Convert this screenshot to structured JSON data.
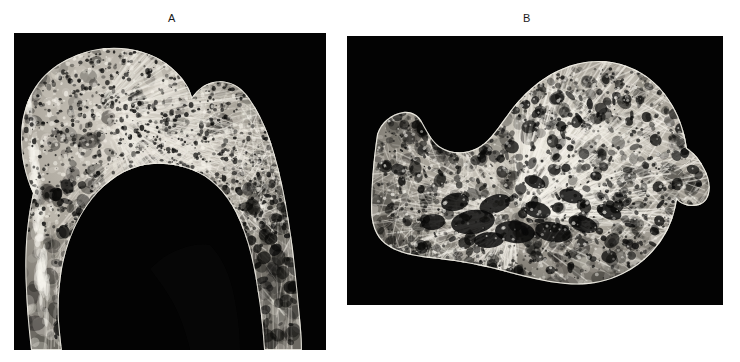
{
  "figure": {
    "background_color": "#ffffff",
    "panel_background_color": "#030303",
    "label_color": "#1a1a1a",
    "panels": [
      {
        "id": "A",
        "label": "A",
        "label_x": 172,
        "label_y": 12,
        "x": 14,
        "y": 33,
        "width": 312,
        "height": 317,
        "subject": "proximal-femur-coronal-section",
        "description": "Coronal cross-section of a proximal femur showing the femoral head, neck, greater trochanter and upper shaft with trabecular (cancellous) bone architecture and a dark medullary cavity.",
        "bone_tone_light": "#e8e4dc",
        "bone_tone_mid": "#a9a49a",
        "bone_tone_dark": "#55524c"
      },
      {
        "id": "B",
        "label": "B",
        "label_x": 527,
        "label_y": 12,
        "x": 347,
        "y": 36,
        "width": 376,
        "height": 269,
        "subject": "calcaneus-sagittal-section",
        "description": "Sagittal cross-section of a calcaneus showing radiating trabecular bundles, large marrow spaces and the dense cortical rim.",
        "bone_tone_light": "#efece4",
        "bone_tone_mid": "#b2ada2",
        "bone_tone_dark": "#5b584f"
      }
    ]
  }
}
